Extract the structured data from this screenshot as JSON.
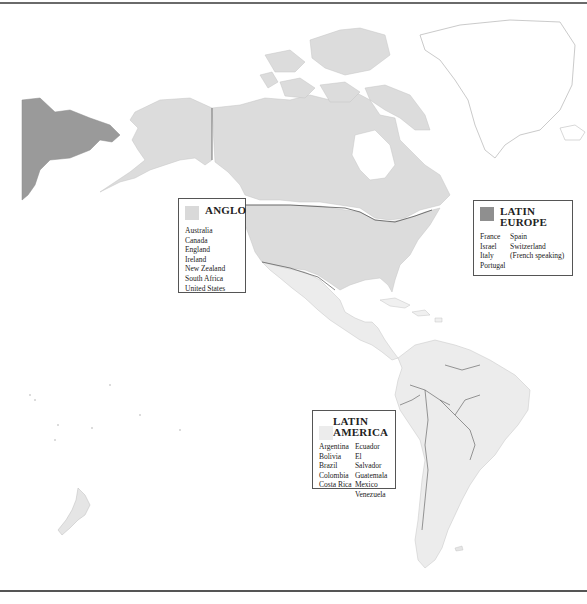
{
  "map": {
    "colors": {
      "anglo": "#d9d9d9",
      "latin_europe": "#9a9a9a",
      "latin_america": "#ebebeb",
      "other_land_outline": "#bdbdbd",
      "ocean": "#ffffff",
      "border_line": "#555555"
    }
  },
  "legends": {
    "anglo": {
      "title": "ANGLO",
      "swatch_color": "#d9d9d9",
      "countries": [
        "Australia",
        "Canada",
        "England",
        "Ireland",
        "New Zealand",
        "South Africa",
        "United States"
      ]
    },
    "latin_europe": {
      "title_line1": "LATIN",
      "title_line2": "EUROPE",
      "swatch_color": "#8f8f8f",
      "col1": [
        "France",
        "Israel",
        "Italy",
        "Portugal"
      ],
      "col2": [
        "Spain",
        "Switzerland",
        "(French speaking)"
      ]
    },
    "latin_america": {
      "title_line1": "LATIN",
      "title_line2": "AMERICA",
      "swatch_color": "#ececec",
      "col1": [
        "Argentina",
        "Bolivia",
        "Brazil",
        "Colombia",
        "Costa Rica"
      ],
      "col2": [
        "Ecuador",
        "El Salvador",
        "Guatemala",
        "Mexico",
        "Venezuela"
      ]
    }
  }
}
